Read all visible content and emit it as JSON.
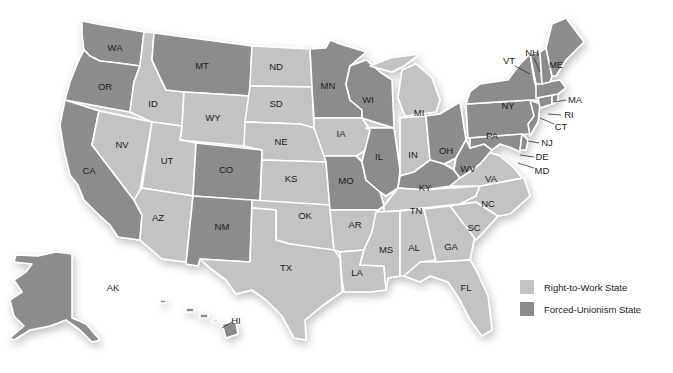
{
  "colors": {
    "right_to_work": "#c3c3c3",
    "forced_unionism": "#8c8c8c",
    "border": "#ffffff",
    "background": "#ffffff"
  },
  "legend": {
    "items": [
      {
        "label": "Right-to-Work State",
        "category": "right_to_work"
      },
      {
        "label": "Forced-Unionism State",
        "category": "forced_unionism"
      }
    ]
  },
  "states": {
    "WA": {
      "label": "WA",
      "category": "forced_unionism"
    },
    "OR": {
      "label": "OR",
      "category": "forced_unionism"
    },
    "CA": {
      "label": "CA",
      "category": "forced_unionism"
    },
    "NV": {
      "label": "NV",
      "category": "right_to_work"
    },
    "ID": {
      "label": "ID",
      "category": "right_to_work"
    },
    "MT": {
      "label": "MT",
      "category": "forced_unionism"
    },
    "WY": {
      "label": "WY",
      "category": "right_to_work"
    },
    "UT": {
      "label": "UT",
      "category": "right_to_work"
    },
    "AZ": {
      "label": "AZ",
      "category": "right_to_work"
    },
    "CO": {
      "label": "CO",
      "category": "forced_unionism"
    },
    "NM": {
      "label": "NM",
      "category": "forced_unionism"
    },
    "ND": {
      "label": "ND",
      "category": "right_to_work"
    },
    "SD": {
      "label": "SD",
      "category": "right_to_work"
    },
    "NE": {
      "label": "NE",
      "category": "right_to_work"
    },
    "KS": {
      "label": "KS",
      "category": "right_to_work"
    },
    "OK": {
      "label": "OK",
      "category": "right_to_work"
    },
    "TX": {
      "label": "TX",
      "category": "right_to_work"
    },
    "MN": {
      "label": "MN",
      "category": "forced_unionism"
    },
    "IA": {
      "label": "IA",
      "category": "right_to_work"
    },
    "MO": {
      "label": "MO",
      "category": "forced_unionism"
    },
    "AR": {
      "label": "AR",
      "category": "right_to_work"
    },
    "LA": {
      "label": "LA",
      "category": "right_to_work"
    },
    "WI": {
      "label": "WI",
      "category": "forced_unionism"
    },
    "IL": {
      "label": "IL",
      "category": "forced_unionism"
    },
    "MI": {
      "label": "MI",
      "category": "right_to_work"
    },
    "IN": {
      "label": "IN",
      "category": "right_to_work"
    },
    "OH": {
      "label": "OH",
      "category": "forced_unionism"
    },
    "KY": {
      "label": "KY",
      "category": "forced_unionism"
    },
    "TN": {
      "label": "TN",
      "category": "right_to_work"
    },
    "MS": {
      "label": "MS",
      "category": "right_to_work"
    },
    "AL": {
      "label": "AL",
      "category": "right_to_work"
    },
    "GA": {
      "label": "GA",
      "category": "right_to_work"
    },
    "FL": {
      "label": "FL",
      "category": "right_to_work"
    },
    "SC": {
      "label": "SC",
      "category": "right_to_work"
    },
    "NC": {
      "label": "NC",
      "category": "right_to_work"
    },
    "VA": {
      "label": "VA",
      "category": "right_to_work"
    },
    "WV": {
      "label": "WV",
      "category": "forced_unionism"
    },
    "PA": {
      "label": "PA",
      "category": "forced_unionism"
    },
    "NY": {
      "label": "NY",
      "category": "forced_unionism"
    },
    "VT": {
      "label": "VT",
      "category": "forced_unionism"
    },
    "NH": {
      "label": "NH",
      "category": "forced_unionism"
    },
    "ME": {
      "label": "ME",
      "category": "forced_unionism"
    },
    "MA": {
      "label": "MA",
      "category": "forced_unionism"
    },
    "RI": {
      "label": "RI",
      "category": "forced_unionism"
    },
    "CT": {
      "label": "CT",
      "category": "forced_unionism"
    },
    "NJ": {
      "label": "NJ",
      "category": "forced_unionism"
    },
    "DE": {
      "label": "DE",
      "category": "forced_unionism"
    },
    "MD": {
      "label": "MD",
      "category": "forced_unionism"
    },
    "AK": {
      "label": "AK",
      "category": "forced_unionism"
    },
    "HI": {
      "label": "HI",
      "category": "forced_unionism"
    }
  }
}
